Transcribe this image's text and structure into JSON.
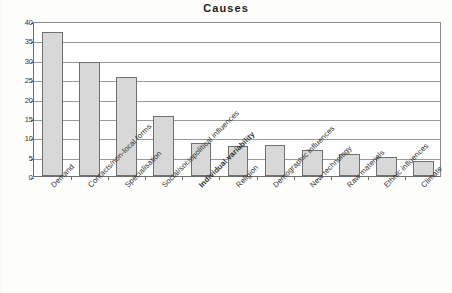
{
  "chart_data": {
    "type": "bar",
    "title": "Causes",
    "xlabel": "",
    "ylabel": "",
    "ylim": [
      0,
      40
    ],
    "yticks": [
      0,
      5,
      10,
      15,
      20,
      25,
      30,
      35,
      40
    ],
    "grid": true,
    "legend": "none",
    "orientation": "vertical",
    "bar_fill_color": "#d8d8d8",
    "bar_border_color": "#707070",
    "categories": [
      "Demand",
      "Contacts/non-local forms",
      "Specialisation",
      "Social/sociopolitical influences",
      "Individual variability",
      "Religion",
      "Demographic influences",
      "New technology",
      "Raw materials",
      "Ethnic influences",
      "Climate"
    ],
    "emphasized_categories": [
      "Individual variability"
    ],
    "values": [
      37.2,
      29.4,
      25.5,
      15.5,
      8.6,
      7.8,
      7.9,
      6.8,
      5.8,
      5.0,
      4.0
    ]
  }
}
